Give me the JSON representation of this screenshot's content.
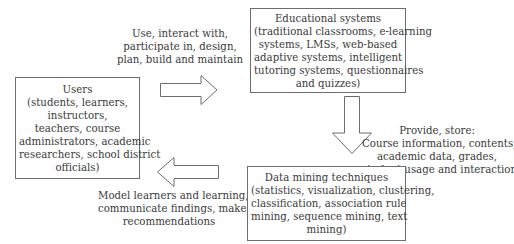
{
  "nodes": {
    "users": {
      "title": "Users",
      "lines": [
        "(students, learners,",
        "instructors,",
        "teachers, course",
        "administrators, academic",
        "researchers, school district",
        "officials)"
      ]
    },
    "educational_systems": {
      "title": "Educational systems",
      "lines": [
        "(traditional classrooms, e-learning",
        "systems, LMSs, web-based",
        "adaptive systems, intelligent",
        "tutoring systems, questionnaires",
        "and quizzes)"
      ]
    },
    "data_mining": {
      "title": "Data mining techniques",
      "lines": [
        "(statistics, visualization, clustering,",
        "classification, association rule",
        "mining, sequence mining, text",
        "mining)"
      ]
    }
  },
  "edges": {
    "users_to_systems": {
      "icon": "right-arrow-icon",
      "lines": [
        "Use, interact with,",
        "participate in, design,",
        "plan, build and maintain"
      ]
    },
    "systems_to_mining": {
      "icon": "down-arrow-icon",
      "lines": [
        "Provide, store:",
        "Course information, contents,",
        "academic data, grades,",
        "student usage and interaction data"
      ]
    },
    "mining_to_users": {
      "icon": "left-arrow-icon",
      "lines": [
        "Model learners and learning,",
        "communicate findings, make",
        "recommendations"
      ]
    }
  },
  "colors": {
    "stroke": "#6d6d6d",
    "text": "#3a3a3a",
    "background": "#ffffff"
  }
}
